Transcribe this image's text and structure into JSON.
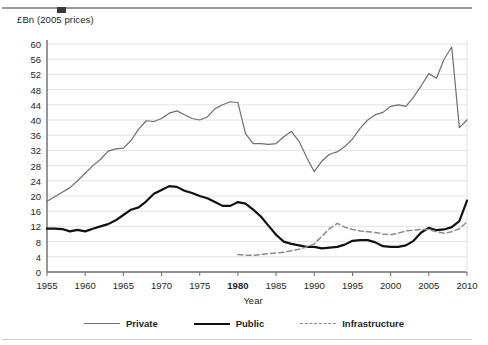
{
  "figure": {
    "y_axis_title": "£Bn (2005 prices)",
    "top_rule": "top-divider-rule"
  },
  "chart_data": {
    "type": "line",
    "title": "",
    "xlabel": "Year",
    "ylabel": "£Bn (2005 prices)",
    "xlim": [
      1955,
      2010
    ],
    "ylim": [
      0,
      60
    ],
    "ytick_step": 4,
    "grid": "horizontal",
    "legend_position": "bottom-center",
    "yticks": [
      0,
      4,
      8,
      12,
      16,
      20,
      24,
      28,
      32,
      36,
      40,
      44,
      48,
      52,
      56,
      60
    ],
    "xticks": [
      1955,
      1960,
      1965,
      1970,
      1975,
      1980,
      1985,
      1990,
      1995,
      2000,
      2005,
      2010
    ],
    "xtick_bold": [
      1980
    ],
    "x": [
      1955,
      1956,
      1957,
      1958,
      1959,
      1960,
      1961,
      1962,
      1963,
      1964,
      1965,
      1966,
      1967,
      1968,
      1969,
      1970,
      1971,
      1972,
      1973,
      1974,
      1975,
      1976,
      1977,
      1978,
      1979,
      1980,
      1981,
      1982,
      1983,
      1984,
      1985,
      1986,
      1987,
      1988,
      1989,
      1990,
      1991,
      1992,
      1993,
      1994,
      1995,
      1996,
      1997,
      1998,
      1999,
      2000,
      2001,
      2002,
      2003,
      2004,
      2005,
      2006,
      2007,
      2008,
      2009,
      2010
    ],
    "series": [
      {
        "name": "Private",
        "style": "solid-thin",
        "color": "#6e6e6e",
        "values": [
          18.6,
          19.8,
          21.0,
          22.2,
          24.0,
          26.0,
          28.0,
          29.6,
          31.8,
          32.4,
          32.6,
          34.6,
          37.6,
          39.8,
          39.6,
          40.4,
          41.8,
          42.4,
          41.4,
          40.4,
          40.0,
          40.8,
          43.0,
          44.0,
          44.8,
          44.6,
          36.4,
          33.8,
          33.8,
          33.6,
          33.8,
          35.6,
          37.0,
          34.4,
          30.2,
          26.4,
          29.2,
          31.0,
          31.6,
          33.0,
          35.0,
          37.8,
          40.0,
          41.4,
          42.0,
          43.6,
          44.0,
          43.6,
          46.0,
          49.0,
          52.2,
          51.0,
          56.0,
          59.2,
          38.0,
          40.0
        ]
      },
      {
        "name": "Public",
        "style": "solid-thick",
        "color": "#111111",
        "values": [
          11.4,
          11.4,
          11.3,
          10.7,
          11.1,
          10.7,
          11.4,
          12.0,
          12.6,
          13.6,
          15.0,
          16.4,
          17.0,
          18.6,
          20.6,
          21.6,
          22.6,
          22.4,
          21.4,
          20.8,
          20.0,
          19.4,
          18.4,
          17.4,
          17.4,
          18.4,
          18.0,
          16.4,
          14.6,
          12.2,
          9.8,
          8.0,
          7.4,
          7.0,
          6.6,
          6.6,
          6.2,
          6.4,
          6.6,
          7.2,
          8.2,
          8.4,
          8.4,
          7.8,
          6.8,
          6.6,
          6.6,
          7.0,
          8.2,
          10.4,
          11.6,
          11.0,
          11.2,
          11.8,
          13.4,
          18.8
        ]
      },
      {
        "name": "Infrastructure",
        "style": "dashed",
        "color": "#8a8a8a",
        "values": [
          null,
          null,
          null,
          null,
          null,
          null,
          null,
          null,
          null,
          null,
          null,
          null,
          null,
          null,
          null,
          null,
          null,
          null,
          null,
          null,
          null,
          null,
          null,
          null,
          null,
          4.6,
          4.4,
          4.4,
          4.6,
          4.8,
          5.0,
          5.2,
          5.6,
          6.0,
          6.6,
          7.4,
          9.4,
          11.4,
          12.8,
          11.8,
          11.2,
          10.8,
          10.6,
          10.4,
          10.0,
          9.8,
          10.2,
          10.8,
          11.0,
          11.2,
          11.2,
          10.6,
          10.2,
          10.6,
          11.4,
          13.2
        ]
      }
    ],
    "legend": [
      {
        "label": "Private",
        "swatch": "thin-gray-line"
      },
      {
        "label": "Public",
        "swatch": "thick-black-line"
      },
      {
        "label": "Infrastructure",
        "swatch": "dashed-gray-line"
      }
    ]
  },
  "colors": {
    "private": "#6e6e6e",
    "public": "#111111",
    "infrastructure": "#8a8a8a",
    "grid": "#e3e3e3",
    "axis": "#6b6b6b",
    "text": "#231f20"
  }
}
